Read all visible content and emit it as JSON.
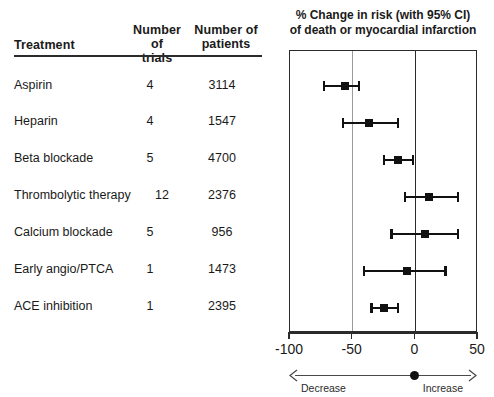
{
  "table": {
    "headers": {
      "treatment": "Treatment",
      "trials_line1": "Number of",
      "trials_line2": "trials",
      "patients_line1": "Number of",
      "patients_line2": "patients"
    },
    "rows": [
      {
        "treatment": "Aspirin",
        "trials": "4",
        "patients": "3114"
      },
      {
        "treatment": "Heparin",
        "trials": "4",
        "patients": "1547"
      },
      {
        "treatment": "Beta blockade",
        "trials": "5",
        "patients": "4700"
      },
      {
        "treatment": "Thrombolytic therapy",
        "trials": "12",
        "patients": "2376"
      },
      {
        "treatment": "Calcium blockade",
        "trials": "5",
        "patients": "956"
      },
      {
        "treatment": "Early angio/PTCA",
        "trials": "1",
        "patients": "1473"
      },
      {
        "treatment": "ACE inhibition",
        "trials": "1",
        "patients": "2395"
      }
    ]
  },
  "plot": {
    "title_line1": "% Change in risk (with 95% CI)",
    "title_line2": "of death or myocardial infarction",
    "direction": {
      "decrease": "Decrease",
      "increase": "Increase"
    }
  },
  "chart_data": {
    "type": "forest",
    "title": "% Change in risk (with 95% CI) of death or myocardial infarction",
    "xlabel": "% Change in risk",
    "ylabel": "",
    "xlim": [
      -100,
      50
    ],
    "xticks": [
      -100,
      -50,
      0,
      50
    ],
    "xticklabels": [
      "-100",
      "-50",
      "0",
      "50"
    ],
    "gridlines": [
      -50,
      0
    ],
    "grid": true,
    "reference_line": 0,
    "categories": [
      "Aspirin",
      "Heparin",
      "Beta blockade",
      "Thrombolytic therapy",
      "Calcium blockade",
      "Early angio/PTCA",
      "ACE inhibition"
    ],
    "values": [
      -56,
      -37,
      -14,
      11,
      8,
      -7,
      -25
    ],
    "ci_low": [
      -73,
      -58,
      -25,
      -8,
      -19,
      -41,
      -35
    ],
    "ci_high": [
      -45,
      -14,
      -2,
      34,
      34,
      24,
      -14
    ],
    "points": [
      {
        "label": "Aspirin",
        "estimate": -56,
        "ci_low": -73,
        "ci_high": -45,
        "trials": 4,
        "patients": 3114
      },
      {
        "label": "Heparin",
        "estimate": -37,
        "ci_low": -58,
        "ci_high": -14,
        "trials": 4,
        "patients": 1547
      },
      {
        "label": "Beta blockade",
        "estimate": -14,
        "ci_low": -25,
        "ci_high": -2,
        "trials": 5,
        "patients": 4700
      },
      {
        "label": "Thrombolytic therapy",
        "estimate": 11,
        "ci_low": -8,
        "ci_high": 34,
        "trials": 12,
        "patients": 2376
      },
      {
        "label": "Calcium blockade",
        "estimate": 8,
        "ci_low": -19,
        "ci_high": 34,
        "trials": 5,
        "patients": 956
      },
      {
        "label": "Early angio/PTCA",
        "estimate": -7,
        "ci_low": -41,
        "ci_high": 24,
        "trials": 1,
        "patients": 1473
      },
      {
        "label": "ACE inhibition",
        "estimate": -25,
        "ci_low": -35,
        "ci_high": -14,
        "trials": 1,
        "patients": 2395
      }
    ],
    "annotations": [
      "Decrease",
      "Increase"
    ]
  }
}
